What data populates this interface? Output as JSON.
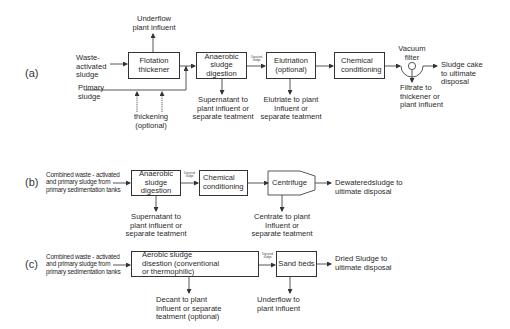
{
  "diagram": {
    "section_a": {
      "label": "(a)",
      "inputs": {
        "waste_activated": "Waste-\nactivated\nsludge",
        "primary": "Primary\nsludge",
        "thickening": "thickening\n(optional)"
      },
      "boxes": {
        "flotation": "Flotation\nthickener",
        "anaerobic": "Anaerobic\nsludge\ndigestion",
        "elutriation": "Elutriation\n(optional)",
        "chemical": "Chemical\nconditioning"
      },
      "vacuum_filter": "Vacuum\nfilter",
      "arrow_label": "Digested\nsludge",
      "outputs": {
        "underflow": "Underflow\nplant influent",
        "supernatant": "Supernatant to\nplant influent or\nseparate teatment",
        "elutriate": "Elutriate to plant\nInfluent or\nseparate teatment",
        "filtrate": "Filtrate to\nthickener or\nplant influent",
        "sludge_cake": "Sludge cake\nto ultimate\ndisposal"
      }
    },
    "section_b": {
      "label": "(b)",
      "input": "Combined waste - activated\nand primary sludge from\nprimary sedimentation tanks",
      "boxes": {
        "anaerobic": "Anaerobic\nsludge\ndigestion",
        "chemical": "Chemical\nconditioning",
        "centrifuge": "Centrifuge"
      },
      "arrow_label": "Digested\nsludge",
      "outputs": {
        "supernatant": "Supernatant to\nplant influent or\nseparate teatment",
        "centrate": "Centrate to plant\nInfluent or\nseparate teatment",
        "dewatered": "Dewateredsludge to\nultimate disposal"
      }
    },
    "section_c": {
      "label": "(c)",
      "input": "Combined waste - activated\nand primary sludge from\nprimary sedimentation tanks",
      "boxes": {
        "aerobic": "Aerobic sludge\ndisestion (conventional\nor thermophilic)",
        "sand_beds": "Sand beds"
      },
      "arrow_label": "Digested\nsludge",
      "outputs": {
        "decant": "Decant to plant\nInfluent or separate\nteatment (optional)",
        "underflow": "Underflow to\nplant influent",
        "dried": "Dried Sludge to\nultimate disposal"
      }
    }
  }
}
